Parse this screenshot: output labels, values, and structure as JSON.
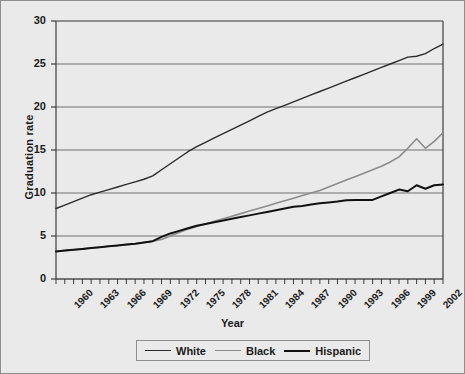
{
  "chart_data": {
    "type": "line",
    "title": "",
    "xlabel": "Year",
    "ylabel": "Graduation rate",
    "xlim": [
      1960,
      2004
    ],
    "ylim": [
      0,
      30
    ],
    "yticks": [
      0,
      5,
      10,
      15,
      20,
      25,
      30
    ],
    "xticks": [
      1960,
      1963,
      1966,
      1969,
      1972,
      1975,
      1978,
      1981,
      1984,
      1987,
      1990,
      1993,
      1996,
      1999,
      2002
    ],
    "x_minor_tick_step": 1,
    "grid": "horizontal",
    "legend_position": "bottom-center",
    "x": [
      1960,
      1961,
      1962,
      1963,
      1964,
      1965,
      1966,
      1967,
      1968,
      1969,
      1970,
      1971,
      1972,
      1973,
      1974,
      1975,
      1976,
      1977,
      1978,
      1979,
      1980,
      1981,
      1982,
      1983,
      1984,
      1985,
      1986,
      1987,
      1988,
      1989,
      1990,
      1991,
      1992,
      1993,
      1994,
      1995,
      1996,
      1997,
      1998,
      1999,
      2000,
      2001,
      2002,
      2003,
      2004
    ],
    "series": [
      {
        "name": "White",
        "color": "#2b2b2b",
        "width": 1.4,
        "values": [
          8.2,
          8.6,
          9.0,
          9.4,
          9.8,
          10.1,
          10.4,
          10.7,
          11.0,
          11.3,
          11.6,
          12.0,
          12.7,
          13.4,
          14.1,
          14.8,
          15.4,
          15.9,
          16.4,
          16.9,
          17.4,
          17.9,
          18.4,
          18.9,
          19.4,
          19.8,
          20.2,
          20.6,
          21.0,
          21.4,
          21.8,
          22.2,
          22.6,
          23.0,
          23.4,
          23.8,
          24.2,
          24.6,
          25.0,
          25.4,
          25.8,
          25.9,
          26.2,
          26.8,
          27.3
        ]
      },
      {
        "name": "Black",
        "color": "#8c8c8c",
        "width": 1.6,
        "values": [
          3.2,
          3.3,
          3.4,
          3.5,
          3.6,
          3.7,
          3.8,
          3.9,
          4.0,
          4.1,
          4.25,
          4.4,
          4.6,
          5.0,
          5.4,
          5.8,
          6.1,
          6.4,
          6.7,
          7.0,
          7.3,
          7.6,
          7.9,
          8.2,
          8.5,
          8.8,
          9.1,
          9.4,
          9.7,
          10.0,
          10.3,
          10.7,
          11.1,
          11.5,
          11.9,
          12.3,
          12.7,
          13.1,
          13.6,
          14.2,
          15.2,
          16.3,
          15.2,
          16.0,
          17.0
        ]
      },
      {
        "name": "Hispanic",
        "color": "#111111",
        "width": 2.0,
        "values": [
          3.2,
          3.3,
          3.4,
          3.5,
          3.6,
          3.7,
          3.8,
          3.9,
          4.0,
          4.1,
          4.25,
          4.4,
          4.9,
          5.3,
          5.6,
          5.9,
          6.2,
          6.4,
          6.6,
          6.8,
          7.0,
          7.2,
          7.4,
          7.6,
          7.8,
          8.0,
          8.2,
          8.4,
          8.5,
          8.65,
          8.8,
          8.9,
          9.0,
          9.15,
          9.2,
          9.2,
          9.2,
          9.6,
          10.0,
          10.4,
          10.2,
          10.9,
          10.5,
          10.9,
          11.0
        ]
      }
    ]
  },
  "legend": {
    "items": [
      {
        "label": "White"
      },
      {
        "label": "Black"
      },
      {
        "label": "Hispanic"
      }
    ]
  },
  "axes": {
    "x_title": "Year",
    "y_title": "Graduation rate"
  }
}
